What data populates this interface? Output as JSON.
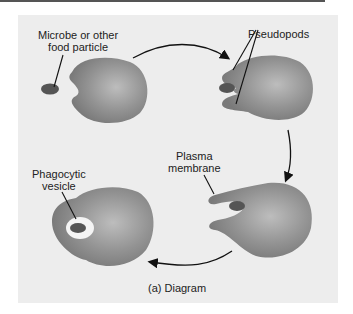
{
  "figure": {
    "caption": "(a) Diagram",
    "labels": {
      "microbe_line1": "Microbe or other",
      "microbe_line2": "food particle",
      "pseudopods": "Pseudopods",
      "plasma_line1": "Plasma",
      "plasma_line2": "membrane",
      "vesicle_line1": "Phagocytic",
      "vesicle_line2": "vesicle"
    },
    "colors": {
      "panel": "#ededed",
      "cell": "#8a8a8a",
      "cell_highlight": "#bdbdbd",
      "particle": "#555555",
      "vesicle": "#f4f4f4"
    },
    "stages": [
      "approach",
      "pseudopods-extend",
      "engulf",
      "phagocytic-vesicle"
    ]
  }
}
